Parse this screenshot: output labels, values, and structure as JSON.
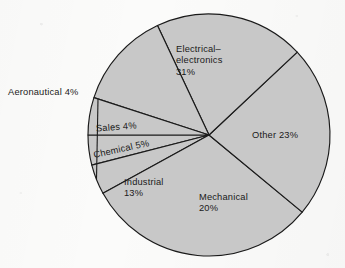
{
  "figure": {
    "kind": "pie-chart",
    "background_color": "#fbfbfa"
  },
  "chart_data": {
    "type": "pie",
    "title": "",
    "subtitle": "",
    "xlabel": "",
    "ylabel": "",
    "grid": false,
    "legend": "none",
    "units": "percent",
    "total": 100,
    "start_angle_deg": 180,
    "direction": "counterclockwise",
    "center": {
      "x": 209,
      "y": 135
    },
    "radius": 121,
    "slice_fill_color": "#c8c8c8",
    "slice_stroke_color": "#1a1a1a",
    "categories": [
      "Sales",
      "Aeronautical",
      "Electrical–electronics",
      "Other",
      "Mechanical",
      "Industrial",
      "Chemical"
    ],
    "values": [
      4,
      4,
      31,
      23,
      20,
      13,
      5
    ],
    "slices": [
      {
        "name": "Sales",
        "value": 4,
        "label_line1": "Sales 4%",
        "label_line2": "",
        "label_placement": "inside",
        "label_rotated": true,
        "label_left": 96,
        "label_top": 122
      },
      {
        "name": "Aeronautical",
        "value": 4,
        "label_line1": "Aeronautical 4%",
        "label_line2": "",
        "label_placement": "outside-left",
        "label_rotated": false,
        "label_left": 8,
        "label_top": 87
      },
      {
        "name": "Electrical–electronics",
        "value": 31,
        "label_line1": "Electrical–",
        "label_line2": "electronics",
        "label_line3": "31%",
        "label_placement": "inside",
        "label_rotated": false,
        "label_left": 176,
        "label_top": 44
      },
      {
        "name": "Other",
        "value": 23,
        "label_line1": "Other 23%",
        "label_line2": "",
        "label_placement": "inside",
        "label_rotated": false,
        "label_left": 252,
        "label_top": 130
      },
      {
        "name": "Mechanical",
        "value": 20,
        "label_line1": "Mechanical",
        "label_line2": "20%",
        "label_placement": "inside",
        "label_rotated": false,
        "label_left": 199,
        "label_top": 192
      },
      {
        "name": "Industrial",
        "value": 13,
        "label_line1": "Industrial",
        "label_line2": "13%",
        "label_placement": "inside",
        "label_rotated": false,
        "label_left": 124,
        "label_top": 177
      },
      {
        "name": "Chemical",
        "value": 5,
        "label_line1": "Chemical 5%",
        "label_line2": "",
        "label_placement": "inside",
        "label_rotated": true,
        "label_left": 93,
        "label_top": 144
      }
    ]
  }
}
